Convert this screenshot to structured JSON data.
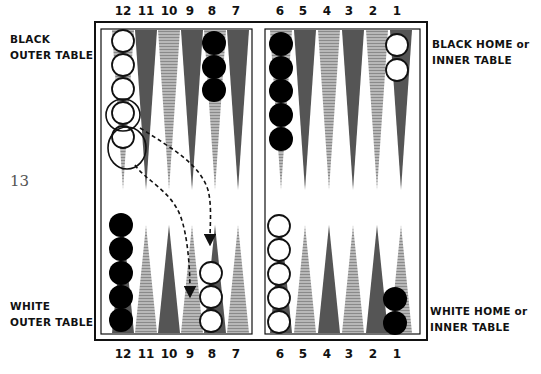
{
  "figure_number": "13",
  "labels": {
    "black_outer_line1": "BLACK",
    "black_outer_line2": "OUTER TABLE",
    "black_home_line1": "BLACK HOME or",
    "black_home_line2": "INNER TABLE",
    "white_outer_line1": "WHITE",
    "white_outer_line2": "OUTER TABLE",
    "white_home_line1": "WHITE HOME or",
    "white_home_line2": "INNER TABLE"
  },
  "top_point_numbers": [
    "12",
    "11",
    "10",
    "9",
    "8",
    "7",
    "6",
    "5",
    "4",
    "3",
    "2",
    "1"
  ],
  "bottom_point_numbers": [
    "12",
    "11",
    "10",
    "9",
    "8",
    "7",
    "6",
    "5",
    "4",
    "3",
    "2",
    "1"
  ],
  "colors": {
    "dark_point": "#555555",
    "light_point": "#aaaaaa",
    "black_checker": "#000000",
    "white_checker": "#ffffff",
    "frame": "#111111"
  },
  "position": {
    "top_row": [
      {
        "point": 12,
        "checkers": 5,
        "color": "white",
        "note": "two top stones circled as moving"
      },
      {
        "point": 8,
        "checkers": 3,
        "color": "black"
      },
      {
        "point": 6,
        "checkers": 5,
        "color": "black"
      },
      {
        "point": 1,
        "checkers": 2,
        "color": "white"
      }
    ],
    "bottom_row": [
      {
        "point": 12,
        "checkers": 5,
        "color": "black"
      },
      {
        "point": 8,
        "checkers": 3,
        "color": "white"
      },
      {
        "point": 6,
        "checkers": 5,
        "color": "white"
      },
      {
        "point": 1,
        "checkers": 2,
        "color": "black"
      }
    ]
  },
  "moves": [
    {
      "from": "top 12",
      "to": "bottom 8",
      "style": "dashed-arrow"
    },
    {
      "from": "top 12",
      "to": "bottom 9",
      "style": "dashed-arrow"
    }
  ]
}
